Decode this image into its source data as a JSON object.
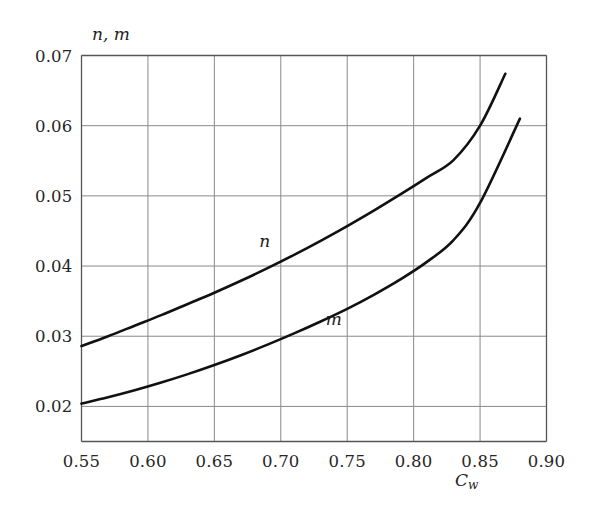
{
  "chart_data": {
    "type": "line",
    "title": "",
    "ylabel": "n, m",
    "xlabel": "C_w",
    "xlabel_base": "C",
    "xlabel_sub": "w",
    "xlim": [
      0.55,
      0.9
    ],
    "ylim": [
      0.015,
      0.07
    ],
    "grid": true,
    "legend_position": "inline-curve-labels",
    "xticks": [
      "0.55",
      "0.60",
      "0.65",
      "0.70",
      "0.75",
      "0.80",
      "0.85",
      "0.90"
    ],
    "xtick_values": [
      0.55,
      0.6,
      0.65,
      0.7,
      0.75,
      0.8,
      0.85,
      0.9
    ],
    "yticks": [
      "0.02",
      "0.03",
      "0.04",
      "0.05",
      "0.06",
      "0.07"
    ],
    "ytick_values": [
      0.02,
      0.03,
      0.04,
      0.05,
      0.06,
      0.07
    ],
    "line_color": "#111111",
    "grid_color": "#8a8a8a",
    "axis_color": "#555555",
    "series": [
      {
        "name": "n",
        "label": "n",
        "label_at": {
          "x": 0.688,
          "y": 0.0436
        },
        "x": [
          0.55,
          0.57,
          0.59,
          0.61,
          0.63,
          0.65,
          0.67,
          0.69,
          0.71,
          0.73,
          0.75,
          0.77,
          0.79,
          0.81,
          0.83,
          0.85,
          0.869
        ],
        "values": [
          0.0286,
          0.03,
          0.0315,
          0.033,
          0.0346,
          0.0362,
          0.0379,
          0.0397,
          0.0416,
          0.0436,
          0.0457,
          0.0479,
          0.0502,
          0.0526,
          0.0551,
          0.06,
          0.0674
        ]
      },
      {
        "name": "m",
        "label": "m",
        "label_at": {
          "x": 0.74,
          "y": 0.0325
        },
        "x": [
          0.55,
          0.57,
          0.59,
          0.61,
          0.63,
          0.65,
          0.67,
          0.69,
          0.71,
          0.73,
          0.75,
          0.77,
          0.79,
          0.81,
          0.83,
          0.85,
          0.88
        ],
        "values": [
          0.0204,
          0.0213,
          0.0223,
          0.0234,
          0.0246,
          0.0259,
          0.0273,
          0.0288,
          0.0304,
          0.0321,
          0.0339,
          0.0359,
          0.0381,
          0.0406,
          0.0437,
          0.049,
          0.061
        ]
      }
    ]
  }
}
